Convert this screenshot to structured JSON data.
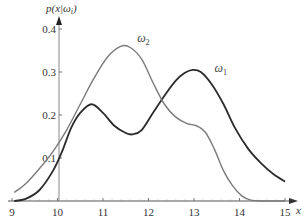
{
  "chart_data": {
    "type": "line",
    "title": "",
    "xlabel": "x",
    "ylabel": "p(x|ωi)",
    "xlim": [
      9,
      15
    ],
    "ylim": [
      0,
      0.42
    ],
    "grid": false,
    "legend": "inline labels",
    "x_ticks": [
      "9",
      "10",
      "11",
      "12",
      "13",
      "14",
      "15"
    ],
    "y_ticks": [
      "0.1",
      "0.2",
      "0.3",
      "0.4"
    ],
    "series": [
      {
        "name": "ω1",
        "label": "ω",
        "subscript": "1",
        "color": "#2b2b2b",
        "width": 1.8,
        "x": [
          9.05,
          9.3,
          9.6,
          9.9,
          10.1,
          10.3,
          10.5,
          10.75,
          11.0,
          11.25,
          11.5,
          11.65,
          11.85,
          12.1,
          12.35,
          12.6,
          12.8,
          12.97,
          13.15,
          13.4,
          13.65,
          13.9,
          14.2,
          14.5,
          14.75,
          15.0
        ],
        "y": [
          0.0,
          0.005,
          0.025,
          0.07,
          0.115,
          0.17,
          0.205,
          0.225,
          0.205,
          0.175,
          0.158,
          0.155,
          0.165,
          0.205,
          0.245,
          0.28,
          0.298,
          0.305,
          0.3,
          0.27,
          0.225,
          0.17,
          0.12,
          0.085,
          0.062,
          0.045
        ],
        "label_pos": [
          13.45,
          0.3
        ]
      },
      {
        "name": "ω2",
        "label": "ω",
        "subscript": "2",
        "color": "#7a7a7a",
        "width": 1.4,
        "x": [
          9.05,
          9.3,
          9.6,
          9.9,
          10.2,
          10.5,
          10.8,
          11.1,
          11.4,
          11.6,
          11.85,
          12.1,
          12.35,
          12.6,
          12.85,
          13.05,
          13.25,
          13.45,
          13.65,
          13.85,
          14.05,
          14.25,
          14.5,
          14.8,
          15.0
        ],
        "y": [
          0.02,
          0.04,
          0.075,
          0.115,
          0.165,
          0.225,
          0.285,
          0.335,
          0.36,
          0.357,
          0.33,
          0.275,
          0.225,
          0.195,
          0.18,
          0.175,
          0.16,
          0.12,
          0.07,
          0.035,
          0.012,
          0.002,
          0.0,
          0.0,
          0.0
        ],
        "label_pos": [
          11.75,
          0.37
        ]
      }
    ]
  },
  "axes": {
    "x_title": "x",
    "y_title": "p(x|ω",
    "y_title_sub": "i",
    "y_title_close": ")"
  }
}
